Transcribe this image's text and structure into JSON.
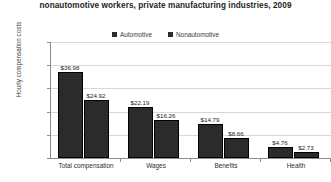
{
  "chart_data": {
    "type": "bar",
    "title": "nonautomotive workers, private manufacturing industries, 2009",
    "xlabel": "",
    "ylabel": "Hourly compensation costs",
    "ylim": [
      0,
      50
    ],
    "ytick_labels": [
      "$50.00",
      "$40.00",
      "$30.00",
      "$20.00",
      "$10.00",
      "$0.00"
    ],
    "ytick_values": [
      50,
      40,
      30,
      20,
      10,
      0
    ],
    "grid": true,
    "legend_position": "top-center",
    "categories": [
      "Total compensation",
      "Wages",
      "Benefits",
      "Health"
    ],
    "series": [
      {
        "name": "Automotive",
        "color": "#2b2b2b",
        "values": [
          36.98,
          22.19,
          14.79,
          4.76
        ],
        "labels": [
          "$36.98",
          "$22.19",
          "$14.79",
          "$4.76"
        ]
      },
      {
        "name": "Nonautomotive",
        "color": "#2b2b2b",
        "values": [
          24.92,
          16.26,
          8.66,
          2.73
        ],
        "labels": [
          "$24.92",
          "$16.26",
          "$8.66",
          "$2.73"
        ]
      }
    ]
  },
  "legend": {
    "entries": [
      {
        "label": "Automotive"
      },
      {
        "label": "Nonautomotive"
      }
    ]
  }
}
